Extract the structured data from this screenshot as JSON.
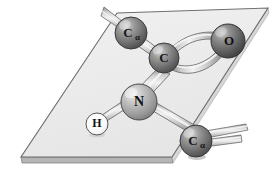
{
  "figure": {
    "background_color": "#ffffff",
    "plane": {
      "name": "peptide-plane",
      "fill_color": "#ededed",
      "edge_color": "#6d6d6d",
      "thickness_color": "#b9b9b9",
      "corners": [
        {
          "x": 117,
          "y": 13
        },
        {
          "x": 268,
          "y": 8
        },
        {
          "x": 172,
          "y": 157
        },
        {
          "x": 21,
          "y": 157
        }
      ]
    },
    "atoms": [
      {
        "id": "c-alpha-top",
        "label": "C",
        "sublabel": "α",
        "element": "C",
        "cx": 131,
        "cy": 33,
        "r": 16,
        "color": "#6f6f6f",
        "highlight_color": "#d2d2d2",
        "label_color": "#1c1c1c",
        "outline": "#3a3a3a"
      },
      {
        "id": "carbon-carbonyl",
        "label": "C",
        "sublabel": "",
        "element": "C",
        "cx": 164,
        "cy": 58,
        "r": 15,
        "color": "#6f6f6f",
        "highlight_color": "#d2d2d2",
        "label_color": "#1c1c1c",
        "outline": "#3a3a3a"
      },
      {
        "id": "oxygen",
        "label": "O",
        "sublabel": "",
        "element": "O",
        "cx": 228,
        "cy": 41,
        "r": 17,
        "color": "#5f5f5f",
        "highlight_color": "#cfcfcf",
        "label_color": "#111111",
        "outline": "#333333"
      },
      {
        "id": "nitrogen",
        "label": "N",
        "sublabel": "",
        "element": "N",
        "cx": 139,
        "cy": 102,
        "r": 18,
        "color": "#9c9c9c",
        "highlight_color": "#e6e6e6",
        "label_color": "#111111",
        "outline": "#4a4a4a"
      },
      {
        "id": "hydrogen",
        "label": "H",
        "sublabel": "",
        "element": "H",
        "cx": 97,
        "cy": 124,
        "r": 11,
        "color": "#fdfdfd",
        "highlight_color": "#ffffff",
        "label_color": "#141414",
        "outline": "#555555"
      },
      {
        "id": "c-alpha-bottom",
        "label": "C",
        "sublabel": "α",
        "element": "C",
        "cx": 196,
        "cy": 141,
        "r": 16,
        "color": "#6a6a6a",
        "highlight_color": "#cccccc",
        "label_color": "#151515",
        "outline": "#383838"
      }
    ],
    "bonds": [
      {
        "id": "bond-calpha-top-to-c",
        "from": "c-alpha-top",
        "to": "carbon-carbonyl",
        "order": 1,
        "width": 9,
        "color": "#c9c9c9",
        "edge_color": "#6a6a6a"
      },
      {
        "id": "bond-c-to-o-double",
        "from": "carbon-carbonyl",
        "to": "oxygen",
        "order": 2,
        "width": 8,
        "color": "#c9c9c9",
        "edge_color": "#6a6a6a"
      },
      {
        "id": "bond-c-to-n",
        "from": "carbon-carbonyl",
        "to": "nitrogen",
        "order": 1,
        "width": 10,
        "color": "#c9c9c9",
        "edge_color": "#6a6a6a"
      },
      {
        "id": "bond-n-to-h",
        "from": "nitrogen",
        "to": "hydrogen",
        "order": 1,
        "width": 8,
        "color": "#c9c9c9",
        "edge_color": "#6a6a6a"
      },
      {
        "id": "bond-n-to-calpha-bottom",
        "from": "nitrogen",
        "to": "c-alpha-bottom",
        "order": 1,
        "width": 10,
        "color": "#c9c9c9",
        "edge_color": "#6a6a6a"
      }
    ],
    "bond_stubs": [
      {
        "id": "stub-calpha-top-upper-left",
        "from_atom": "c-alpha-top",
        "x1": 127,
        "y1": 28,
        "x2": 104,
        "y2": 12,
        "width": 7,
        "color": "#c9c9c9",
        "edge_color": "#6a6a6a"
      },
      {
        "id": "stub-calpha-bottom-right-upper",
        "from_atom": "c-alpha-bottom",
        "x1": 198,
        "y1": 136,
        "x2": 243,
        "y2": 128,
        "width": 7,
        "color": "#c9c9c9",
        "edge_color": "#6a6a6a"
      },
      {
        "id": "stub-calpha-bottom-right-lower",
        "from_atom": "c-alpha-bottom",
        "x1": 200,
        "y1": 145,
        "x2": 240,
        "y2": 140,
        "width": 7,
        "color": "#c9c9c9",
        "edge_color": "#6a6a6a"
      }
    ]
  }
}
